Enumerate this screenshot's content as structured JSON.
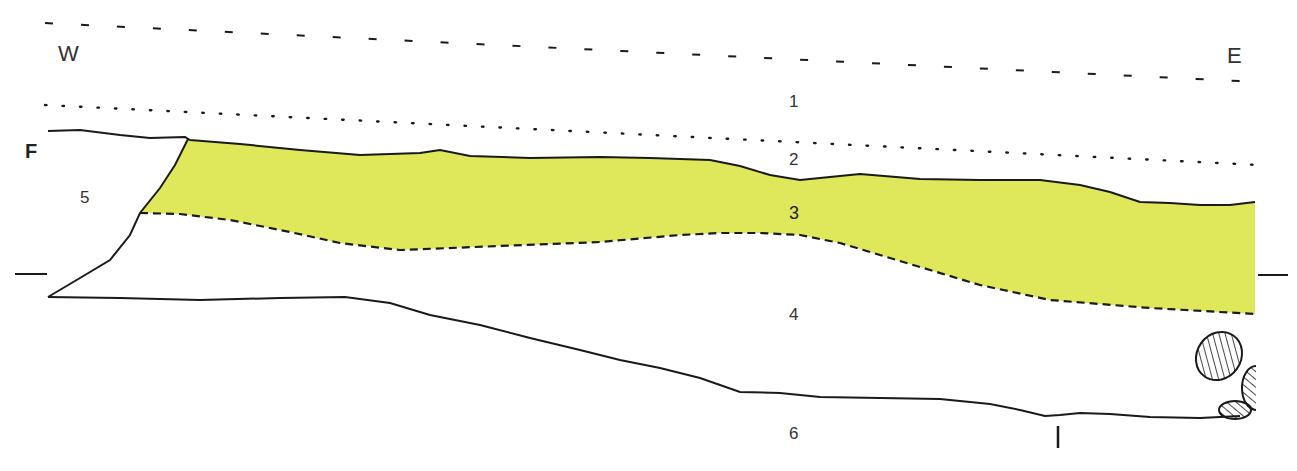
{
  "diagram": {
    "type": "stratigraphic-section",
    "orientation": {
      "west_label": "W",
      "east_label": "E"
    },
    "marker_label": "F",
    "layers": [
      {
        "id": "1",
        "label": "1"
      },
      {
        "id": "2",
        "label": "2"
      },
      {
        "id": "3",
        "label": "3",
        "fill": "#dfe85a"
      },
      {
        "id": "4",
        "label": "4"
      },
      {
        "id": "5",
        "label": "5"
      },
      {
        "id": "6",
        "label": "6"
      }
    ],
    "colors": {
      "layer3_fill": "#dfe85a",
      "line": "#1a1a1a",
      "background": "#ffffff",
      "stone_hatch": "#1a1a1a"
    },
    "features": [
      "dashed upper boundary",
      "dotted boundary",
      "solid surface line",
      "dashed lower boundary of layer 3",
      "horizontal datum ticks left and right",
      "hatched stones at east end",
      "vertical tick mark near bottom"
    ]
  }
}
